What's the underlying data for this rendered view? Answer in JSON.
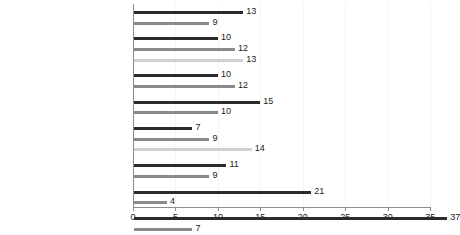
{
  "chart_data": {
    "type": "bar",
    "orientation": "horizontal",
    "title": "",
    "subtitle": "",
    "xlabel": "",
    "ylabel": "",
    "xlim": [
      0,
      35
    ],
    "xticks": [
      0,
      5,
      10,
      15,
      20,
      25,
      30,
      35
    ],
    "xtick_labels": [
      "0",
      "5",
      "10",
      "15",
      "20",
      "25",
      "30",
      "35"
    ],
    "grid": true,
    "grid_axis": "x",
    "legend": "none",
    "colors": {
      "dark": "#2b2b2b",
      "mid": "#8a8a8a",
      "light": "#cfcfcf",
      "axis": "#8c8c8c",
      "gridline": "#f4f4f4",
      "background": "#ffffff",
      "text": "#1a1a1a"
    },
    "groups": [
      {
        "name": "gender",
        "bars": [
          {
            "label": "Male",
            "value": 13,
            "tone": "dark"
          },
          {
            "label": "Female",
            "value": 9,
            "tone": "mid"
          }
        ]
      },
      {
        "name": "age",
        "bars": [
          {
            "label": "26–30",
            "value": 10,
            "tone": "dark"
          },
          {
            "label": "18–25",
            "value": 12,
            "tone": "mid"
          },
          {
            "label": "Under 18",
            "value": 13,
            "tone": "light"
          }
        ]
      },
      {
        "name": "living-situation",
        "bars": [
          {
            "label": "Lives with parents",
            "value": 10,
            "tone": "dark"
          },
          {
            "label": "Other",
            "value": 12,
            "tone": "mid"
          }
        ]
      },
      {
        "name": "parent-immigration",
        "bars": [
          {
            "label": "Parent immigrant",
            "value": 15,
            "tone": "dark"
          },
          {
            "label": "Parent not immigrant",
            "value": 10,
            "tone": "mid"
          }
        ]
      },
      {
        "name": "urbanicity",
        "bars": [
          {
            "label": "Non-urban",
            "value": 7,
            "tone": "dark"
          },
          {
            "label": "Small town",
            "value": 9,
            "tone": "mid"
          },
          {
            "label": "Big city",
            "value": 14,
            "tone": "light"
          }
        ]
      },
      {
        "name": "internet-use",
        "bars": [
          {
            "label": "Internet several times a day",
            "value": 11,
            "tone": "dark"
          },
          {
            "label": "Internet less often",
            "value": 9,
            "tone": "mid"
          }
        ]
      },
      {
        "name": "cyberhate-exposure",
        "bars": [
          {
            "label": "Exposed to cyberhate",
            "value": 21,
            "tone": "dark"
          },
          {
            "label": "Not exposed to cyberhate",
            "value": 4,
            "tone": "mid"
          }
        ]
      },
      {
        "name": "cyberhate-victimisation",
        "bars": [
          {
            "label": "Cyberhate victim",
            "value": 37,
            "tone": "dark"
          },
          {
            "label": "Not a cyberhate victim",
            "value": 7,
            "tone": "mid"
          }
        ]
      }
    ]
  }
}
